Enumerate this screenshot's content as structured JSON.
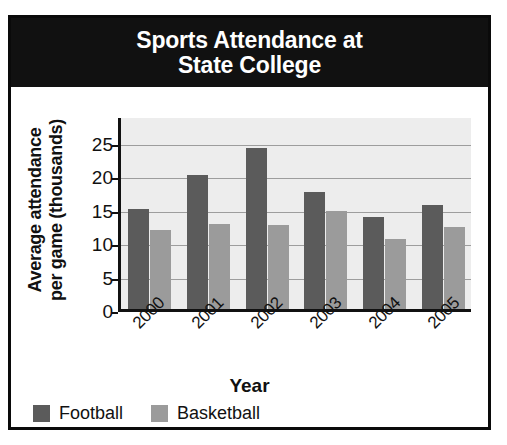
{
  "chart_data": {
    "type": "bar",
    "title": "Sports Attendance at State College",
    "title_lines": [
      "Sports Attendance at",
      "State College"
    ],
    "xlabel": "Year",
    "ylabel": "Average attendance per game (thousands)",
    "ylabel_lines": [
      "Average attendance",
      "per game (thousands)"
    ],
    "categories": [
      "2000",
      "2001",
      "2002",
      "2003",
      "2004",
      "2005"
    ],
    "series": [
      {
        "name": "Football",
        "color": "#5b5b5b",
        "values": [
          15.0,
          20.0,
          24.0,
          17.5,
          13.7,
          15.5
        ]
      },
      {
        "name": "Basketball",
        "color": "#9b9b9b",
        "values": [
          11.8,
          12.7,
          12.5,
          14.7,
          10.5,
          12.3
        ]
      }
    ],
    "ylim": [
      0,
      29
    ],
    "yticks": [
      0,
      5,
      10,
      15,
      20,
      25
    ],
    "ytick_labels": [
      "0",
      "5",
      "10",
      "15",
      "20",
      "25"
    ],
    "grid": true,
    "legend_position": "bottom-left",
    "plot_background": "#ededed",
    "banner_background": "#111111",
    "banner_text_color": "#ffffff"
  },
  "legend": {
    "items": [
      {
        "label": "Football",
        "color": "#5b5b5b"
      },
      {
        "label": "Basketball",
        "color": "#9b9b9b"
      }
    ]
  }
}
